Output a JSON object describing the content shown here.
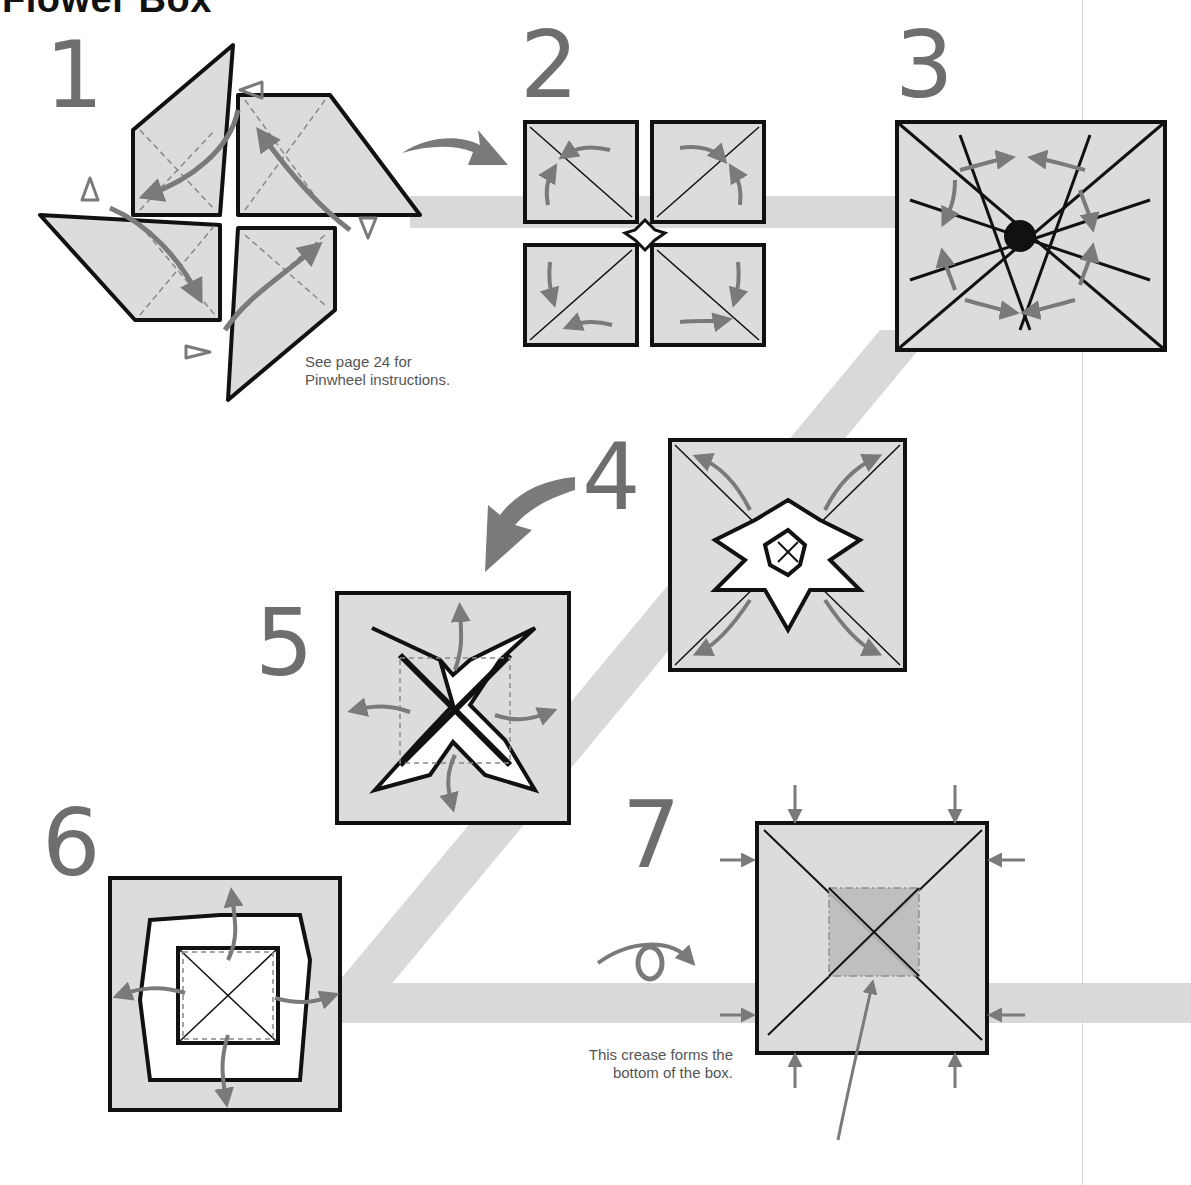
{
  "page": {
    "title": "Flower Box",
    "background": "#ffffff",
    "colors": {
      "paper": "#dcdcdc",
      "paper_dark": "#bcbcbc",
      "outline": "#111111",
      "arrow": "#7a7a7a",
      "guide_band": "#d9d9d9",
      "step_number": "#6e6e6e",
      "note_text": "#555555"
    }
  },
  "steps": [
    {
      "number": "1",
      "description": "pinwheel base with squash-fold arrows"
    },
    {
      "number": "2",
      "description": "square with four petal folds and rotation arrows"
    },
    {
      "number": "3",
      "description": "collapsed base with curved arrows"
    },
    {
      "number": "4",
      "description": "opened flower with diagonal outward arrows"
    },
    {
      "number": "5",
      "description": "crossed points with outward arrows"
    },
    {
      "number": "6",
      "description": "center square with dashed crease"
    },
    {
      "number": "7",
      "description": "finished box viewed from underside"
    }
  ],
  "notes": {
    "step1": [
      "See page 24 for",
      "Pinwheel instructions."
    ],
    "step7": [
      "This crease forms the",
      "bottom of the box."
    ]
  },
  "symbols": {
    "turn_over": "eye-turn-over-icon",
    "next_step": "curved-arrow-icon"
  }
}
